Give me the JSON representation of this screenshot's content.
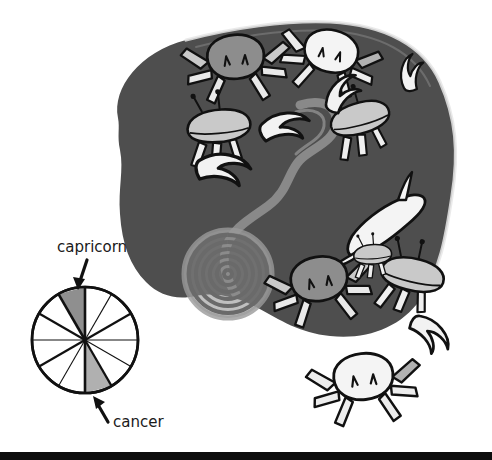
{
  "figure": {
    "name": "zodiac-crabs-illustration",
    "background_color": "#ffffff",
    "blob_color": "#4e4e4e",
    "blob_outline_color": "#e8e8e8",
    "spiral_color": "#8c8c8c",
    "tendril_color": "#8c8c8c",
    "crab_light_color": "#f2f2f2",
    "crab_mid_color": "#b5b5b5",
    "crab_dark_color": "#6e6e6e",
    "crab_outline_color": "#111111",
    "bottom_rule_color": "#0d0d0d",
    "crab_count": 8
  },
  "wheel": {
    "name": "zodiac-wheel",
    "segments": 12,
    "center_x": 85,
    "center_y": 340,
    "radius": 53,
    "outline_color": "#111111",
    "fill_color": "#ffffff",
    "highlight_capricorn_color": "#8f8f8f",
    "highlight_cancer_color": "#b0b0b0",
    "capricorn_segment_index": 11,
    "cancer_segment_index": 5,
    "segment_labels": [
      "aries",
      "taurus",
      "gemini",
      "cancer",
      "leo",
      "virgo",
      "libra",
      "scorpio",
      "sagittarius",
      "capricorn",
      "aquarius",
      "pisces"
    ]
  },
  "annotations": {
    "capricorn": {
      "label": "capricorn",
      "label_x": 57,
      "label_y": 252,
      "arrow_direction": "down",
      "arrow_from_x": 85,
      "arrow_from_y": 261,
      "arrow_to_x": 76,
      "arrow_to_y": 287
    },
    "cancer": {
      "label": "cancer",
      "label_x": 113,
      "label_y": 427,
      "arrow_direction": "up-left",
      "arrow_from_x": 110,
      "arrow_from_y": 424,
      "arrow_to_x": 93,
      "arrow_to_y": 398
    }
  }
}
